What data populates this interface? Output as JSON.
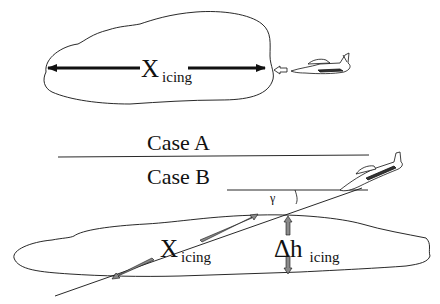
{
  "diagram": {
    "top_cut_text": "",
    "case_a": {
      "label": "Case A",
      "distance_symbol": "X",
      "distance_subscript": "icing"
    },
    "case_b": {
      "label": "Case B",
      "angle_symbol": "γ",
      "distance_symbol": "X",
      "distance_subscript": "icing",
      "height_symbol": "Δh",
      "height_subscript": "icing"
    },
    "colors": {
      "line": "#111111",
      "grey_arrow": "#8a8a8a",
      "background": "#ffffff"
    }
  }
}
